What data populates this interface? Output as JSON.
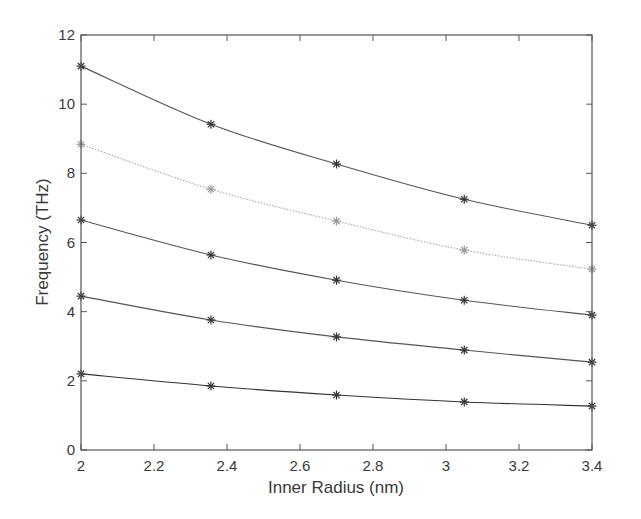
{
  "chart_data": {
    "type": "line",
    "title": "",
    "xlabel": "Inner Radius (nm)",
    "ylabel": "Frequency (THz)",
    "xlim": [
      2,
      3.4
    ],
    "ylim": [
      0,
      12
    ],
    "xticks": [
      2,
      2.2,
      2.4,
      2.6,
      2.8,
      3,
      3.2,
      3.4
    ],
    "xtick_labels": [
      "2",
      "2.2",
      "2.4",
      "2.6",
      "2.8",
      "3",
      "3.2",
      "3.4"
    ],
    "yticks": [
      0,
      2,
      4,
      6,
      8,
      10,
      12
    ],
    "ytick_labels": [
      "0",
      "2",
      "4",
      "6",
      "8",
      "10",
      "12"
    ],
    "grid": false,
    "legend": null,
    "marker": "asterisk",
    "x": [
      2.0,
      2.356,
      2.7,
      3.05,
      3.4
    ],
    "series": [
      {
        "name": "mode-5",
        "values": [
          11.1,
          9.42,
          8.27,
          7.25,
          6.5
        ],
        "color": "#555555",
        "dash": "solid"
      },
      {
        "name": "mode-4",
        "values": [
          8.84,
          7.54,
          6.62,
          5.78,
          5.23
        ],
        "color": "#aaaaaa",
        "dash": "dotted"
      },
      {
        "name": "mode-3",
        "values": [
          6.65,
          5.64,
          4.91,
          4.33,
          3.9
        ],
        "color": "#555555",
        "dash": "solid"
      },
      {
        "name": "mode-2",
        "values": [
          4.45,
          3.76,
          3.27,
          2.89,
          2.54
        ],
        "color": "#555555",
        "dash": "solid"
      },
      {
        "name": "mode-1",
        "values": [
          2.2,
          1.85,
          1.59,
          1.39,
          1.27
        ],
        "color": "#333333",
        "dash": "solid"
      }
    ]
  },
  "colors": {
    "axis": "#555555",
    "text": "#3a3a3a",
    "background": "#ffffff"
  }
}
